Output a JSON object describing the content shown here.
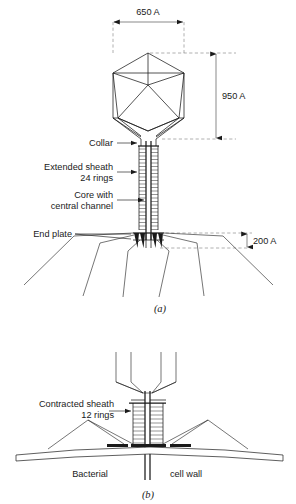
{
  "figure": {
    "panels": [
      {
        "id": "a",
        "letter": "(a)",
        "caption": "(a)",
        "labels": [
          {
            "name": "collar",
            "text": "Collar"
          },
          {
            "name": "extended-sheath",
            "line1": "Extended sheath",
            "line2": "24 rings"
          },
          {
            "name": "core",
            "line1": "Core with",
            "line2": "central channel"
          },
          {
            "name": "end-plate",
            "text": "End plate"
          }
        ],
        "dimensions": [
          {
            "name": "head-width",
            "text": "650 A",
            "orientation": "horizontal"
          },
          {
            "name": "head-height",
            "text": "950 A",
            "orientation": "vertical"
          },
          {
            "name": "base-height",
            "text": "200 A",
            "orientation": "vertical"
          }
        ],
        "sheath_rings": 24
      },
      {
        "id": "b",
        "letter": "(b)",
        "caption": "(b)",
        "labels": [
          {
            "name": "contracted-sheath",
            "line1": "Contracted sheath",
            "line2": "12 rings"
          },
          {
            "name": "bacterial",
            "text": "Bacterial"
          },
          {
            "name": "cell-wall",
            "text": "cell wall"
          }
        ],
        "sheath_rings": 12
      }
    ],
    "colors": {
      "ink": "#1a1a1a",
      "dashed": "#6e6e6e",
      "background": "#ffffff"
    }
  }
}
